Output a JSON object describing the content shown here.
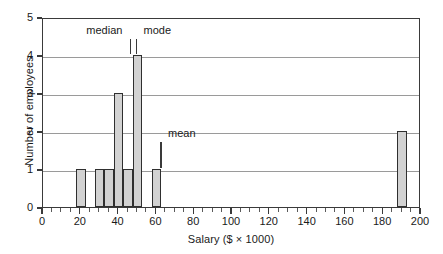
{
  "chart_data": {
    "type": "bar",
    "title": "",
    "xlabel": "Salary ($ × 1000)",
    "ylabel": "Number of employees",
    "xlim": [
      0,
      200
    ],
    "ylim": [
      0,
      5
    ],
    "grid": true,
    "legend": "none",
    "bin_width": 5,
    "x_major_tick_step": 20,
    "x_minor_tick_step": 5,
    "y_tick_step": 1,
    "xticklabels": [
      "0",
      "20",
      "40",
      "60",
      "80",
      "100",
      "120",
      "140",
      "160",
      "180",
      "200"
    ],
    "xtickvalues": [
      0,
      20,
      40,
      60,
      80,
      100,
      120,
      140,
      160,
      180,
      200
    ],
    "yticklabels": [
      "0",
      "1",
      "2",
      "3",
      "4",
      "5"
    ],
    "ytickvalues": [
      0,
      1,
      2,
      3,
      4,
      5
    ],
    "bars": [
      {
        "bin_start": 17.5,
        "bin_end": 22.5,
        "value": 1
      },
      {
        "bin_start": 27.5,
        "bin_end": 32.5,
        "value": 1
      },
      {
        "bin_start": 32.5,
        "bin_end": 37.5,
        "value": 1
      },
      {
        "bin_start": 37.5,
        "bin_end": 42.5,
        "value": 3
      },
      {
        "bin_start": 42.5,
        "bin_end": 47.5,
        "value": 1
      },
      {
        "bin_start": 47.5,
        "bin_end": 52.5,
        "value": 4
      },
      {
        "bin_start": 57.5,
        "bin_end": 62.5,
        "value": 1
      },
      {
        "bin_start": 187.5,
        "bin_end": 192.5,
        "value": 2
      }
    ],
    "annotations": [
      {
        "name": "median",
        "label": "median",
        "x": 47,
        "label_x": 33,
        "marker_top": 4.45,
        "marker_bottom": 4.05
      },
      {
        "name": "mode",
        "label": "mode",
        "x": 50,
        "label_x": 61,
        "marker_top": 4.45,
        "marker_bottom": 4.05
      },
      {
        "name": "mean",
        "label": "mean",
        "x": 63,
        "label_x": 74,
        "marker_top": 1.75,
        "marker_bottom": 1.05
      }
    ],
    "colors": {
      "bar_fill": "#d2d2d2",
      "bar_edge": "#2f2f2f",
      "gridline": "#9a9a9a",
      "axis": "#3a3a3a",
      "text": "#1a1a1a",
      "background": "#ffffff"
    }
  }
}
